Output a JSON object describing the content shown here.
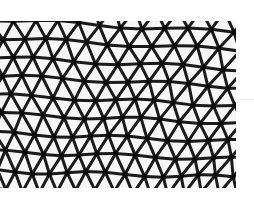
{
  "image": {
    "subject": "geodesic lattice roof structure",
    "colors": {
      "background": "#ffffff",
      "sky": "#f7f7f7",
      "beam": "#1a1a1a",
      "node": "#0a0a0a"
    }
  }
}
